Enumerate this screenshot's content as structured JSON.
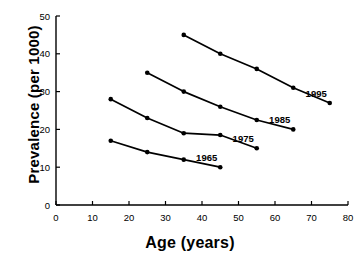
{
  "chart_data": {
    "type": "line",
    "title": "",
    "xlabel": "Age (years)",
    "ylabel": "Prevalence (per 1000)",
    "xlim": [
      0,
      80
    ],
    "ylim": [
      0,
      50
    ],
    "xticks": [
      "0",
      "10",
      "20",
      "30",
      "40",
      "50",
      "60",
      "70",
      "80"
    ],
    "yticks": [
      "0",
      "10",
      "20",
      "30",
      "40",
      "50"
    ],
    "grid": false,
    "legend_position": "inline-end-of-line",
    "marker": "filled-circle",
    "line_color": "#000000",
    "series": [
      {
        "name": "1965",
        "label": "1965",
        "x": [
          15,
          25,
          35,
          45
        ],
        "values": [
          17,
          14,
          12,
          10
        ]
      },
      {
        "name": "1975",
        "label": "1975",
        "x": [
          15,
          25,
          35,
          45,
          55
        ],
        "values": [
          28,
          23,
          19,
          18.5,
          15
        ]
      },
      {
        "name": "1985",
        "label": "1985",
        "x": [
          25,
          35,
          45,
          55,
          65
        ],
        "values": [
          35,
          30,
          26,
          22.5,
          20
        ]
      },
      {
        "name": "1995",
        "label": "1995",
        "x": [
          35,
          45,
          55,
          65,
          75
        ],
        "values": [
          45,
          40,
          36,
          31,
          27
        ]
      }
    ]
  }
}
